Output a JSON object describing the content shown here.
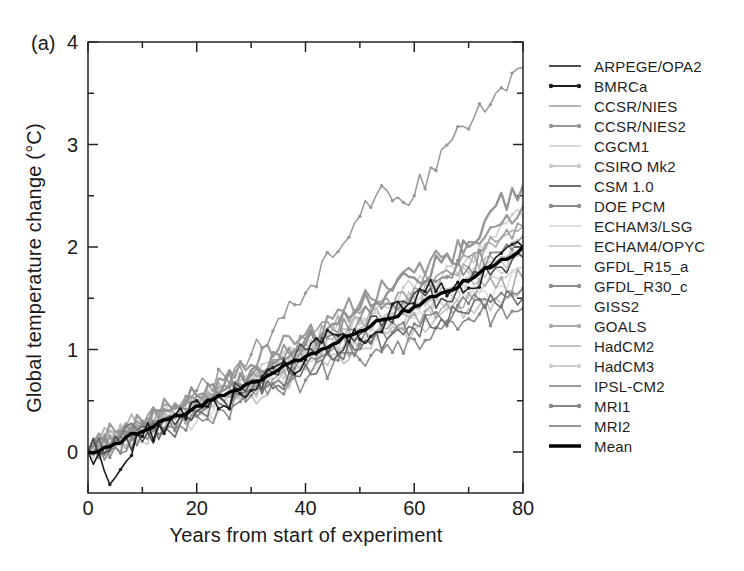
{
  "panel_label": "(a)",
  "chart_data": {
    "type": "line",
    "title": "",
    "xlabel": "Years from start of experiment",
    "ylabel": "Global temperature change (°C)",
    "xlim": [
      0,
      80
    ],
    "ylim": [
      -0.4,
      4.0
    ],
    "x_ticks_major": [
      0,
      20,
      40,
      60,
      80
    ],
    "x_ticks_minor": [
      10,
      30,
      50,
      70
    ],
    "y_ticks_major": [
      0,
      1,
      2,
      3,
      4
    ],
    "y_ticks_minor": [
      0.5,
      1.5,
      2.5,
      3.5
    ],
    "grid": false,
    "legend_position": "right",
    "frame_color": "#242424",
    "text_color": "#1a1a1a",
    "sample_years": [
      0,
      5,
      10,
      15,
      20,
      25,
      30,
      35,
      40,
      45,
      50,
      55,
      60,
      65,
      70,
      75,
      80
    ],
    "series": [
      {
        "name": "ARPEGE/OPA2",
        "color": "#4f4f4f",
        "line_width": 1.6,
        "markers": false,
        "values": [
          0,
          0.15,
          0.1,
          0.35,
          0.4,
          0.5,
          0.7,
          0.75,
          1.0,
          1.05,
          1.15,
          1.3,
          1.55,
          1.5,
          1.65,
          1.8,
          1.9
        ]
      },
      {
        "name": "BMRCa",
        "color": "#1c1c1c",
        "line_width": 1.6,
        "markers": true,
        "values": [
          0,
          -0.25,
          0.15,
          0.3,
          0.5,
          0.45,
          0.6,
          0.85,
          0.9,
          1.15,
          1.1,
          1.3,
          1.45,
          1.65,
          1.6,
          1.9,
          2.0
        ]
      },
      {
        "name": "CCSR/NIES",
        "color": "#b4b4b4",
        "line_width": 1.8,
        "markers": false,
        "values": [
          0,
          0.2,
          0.3,
          0.3,
          0.5,
          0.65,
          0.6,
          0.9,
          1.0,
          1.2,
          1.3,
          1.45,
          1.4,
          1.7,
          1.8,
          2.0,
          2.2
        ]
      },
      {
        "name": "CCSR/NIES2",
        "color": "#989898",
        "line_width": 1.5,
        "markers": true,
        "values": [
          0,
          0.1,
          0.25,
          0.4,
          0.6,
          0.75,
          0.95,
          1.3,
          1.55,
          1.9,
          2.3,
          2.55,
          2.5,
          2.95,
          3.15,
          3.5,
          3.75
        ]
      },
      {
        "name": "CGCM1",
        "color": "#d7d7d7",
        "line_width": 1.8,
        "markers": false,
        "values": [
          0,
          0.05,
          0.2,
          0.35,
          0.3,
          0.5,
          0.6,
          0.7,
          0.9,
          1.0,
          1.15,
          1.2,
          1.4,
          1.45,
          1.6,
          1.7,
          1.8
        ]
      },
      {
        "name": "CSIRO Mk2",
        "color": "#cbcbcb",
        "line_width": 1.6,
        "markers": true,
        "values": [
          0,
          0.15,
          0.1,
          0.3,
          0.45,
          0.55,
          0.7,
          0.8,
          0.95,
          1.05,
          1.25,
          1.3,
          1.5,
          1.55,
          1.75,
          1.85,
          2.0
        ]
      },
      {
        "name": "CSM 1.0",
        "color": "#6f6f6f",
        "line_width": 1.6,
        "markers": false,
        "values": [
          0,
          0.1,
          0.25,
          0.2,
          0.4,
          0.45,
          0.6,
          0.65,
          0.85,
          0.9,
          1.0,
          1.1,
          1.2,
          1.3,
          1.35,
          1.45,
          1.5
        ]
      },
      {
        "name": "DOE PCM",
        "color": "#8c8c8c",
        "line_width": 1.6,
        "markers": true,
        "values": [
          0,
          0.05,
          0.15,
          0.25,
          0.35,
          0.4,
          0.55,
          0.6,
          0.7,
          0.85,
          0.9,
          1.05,
          1.1,
          1.2,
          1.3,
          1.35,
          1.4
        ]
      },
      {
        "name": "ECHAM3/LSG",
        "color": "#e0e0e0",
        "line_width": 1.8,
        "markers": false,
        "values": [
          0,
          0.2,
          0.25,
          0.4,
          0.35,
          0.55,
          0.6,
          0.8,
          0.85,
          1.0,
          1.1,
          1.25,
          1.3,
          1.45,
          1.5,
          1.6,
          1.7
        ]
      },
      {
        "name": "ECHAM4/OPYC",
        "color": "#d2d2d2",
        "line_width": 1.8,
        "markers": false,
        "values": [
          0,
          0.1,
          0.3,
          0.25,
          0.45,
          0.5,
          0.65,
          0.85,
          0.9,
          1.1,
          1.2,
          1.3,
          1.5,
          1.55,
          1.7,
          1.8,
          1.9
        ]
      },
      {
        "name": "GFDL_R15_a",
        "color": "#a0a0a0",
        "line_width": 1.7,
        "markers": false,
        "values": [
          0,
          0.2,
          0.25,
          0.45,
          0.5,
          0.65,
          0.8,
          0.9,
          1.1,
          1.2,
          1.35,
          1.5,
          1.6,
          1.75,
          1.9,
          2.05,
          2.2
        ]
      },
      {
        "name": "GFDL_R30_c",
        "color": "#8f8f8f",
        "line_width": 1.6,
        "markers": true,
        "values": [
          0,
          0.1,
          0.3,
          0.35,
          0.5,
          0.6,
          0.75,
          0.9,
          1.05,
          1.15,
          1.3,
          1.45,
          1.55,
          1.7,
          1.8,
          1.95,
          2.1
        ]
      },
      {
        "name": "GISS2",
        "color": "#c6c6c6",
        "line_width": 1.8,
        "markers": false,
        "values": [
          0,
          0.15,
          0.2,
          0.3,
          0.4,
          0.5,
          0.55,
          0.7,
          0.8,
          0.95,
          1.0,
          1.15,
          1.2,
          1.35,
          1.4,
          1.5,
          1.6
        ]
      },
      {
        "name": "GOALS",
        "color": "#ababab",
        "line_width": 1.6,
        "markers": true,
        "values": [
          0,
          0.1,
          0.2,
          0.35,
          0.4,
          0.55,
          0.65,
          0.75,
          0.9,
          1.0,
          1.1,
          1.2,
          1.35,
          1.4,
          1.55,
          1.6,
          1.7
        ]
      },
      {
        "name": "HadCM2",
        "color": "#c2c2c2",
        "line_width": 2.0,
        "markers": false,
        "values": [
          0,
          0.15,
          0.25,
          0.35,
          0.5,
          0.6,
          0.7,
          0.85,
          1.0,
          1.1,
          1.2,
          1.35,
          1.45,
          1.6,
          1.7,
          1.85,
          2.0
        ]
      },
      {
        "name": "HadCM3",
        "color": "#cfcfcf",
        "line_width": 1.6,
        "markers": true,
        "values": [
          0,
          0.1,
          0.2,
          0.4,
          0.45,
          0.6,
          0.75,
          0.85,
          1.05,
          1.15,
          1.3,
          1.4,
          1.6,
          1.7,
          1.9,
          2.1,
          2.3
        ]
      },
      {
        "name": "IPSL-CM2",
        "color": "#9b9b9b",
        "line_width": 2.2,
        "markers": false,
        "values": [
          0,
          0.2,
          0.3,
          0.45,
          0.55,
          0.7,
          0.85,
          1.0,
          1.15,
          1.3,
          1.45,
          1.6,
          1.75,
          1.9,
          2.05,
          2.2,
          2.4
        ]
      },
      {
        "name": "MRI1",
        "color": "#878787",
        "line_width": 1.6,
        "markers": true,
        "values": [
          0,
          0.05,
          0.2,
          0.3,
          0.35,
          0.5,
          0.6,
          0.7,
          0.85,
          0.9,
          1.05,
          1.1,
          1.25,
          1.3,
          1.45,
          1.5,
          1.6
        ]
      },
      {
        "name": "MRI2",
        "color": "#949494",
        "line_width": 2.4,
        "markers": false,
        "values": [
          0,
          0.15,
          0.3,
          0.4,
          0.55,
          0.65,
          0.8,
          0.95,
          1.1,
          1.25,
          1.4,
          1.55,
          1.7,
          1.85,
          2.0,
          2.4,
          2.6
        ]
      },
      {
        "name": "Mean",
        "color": "#000000",
        "line_width": 3.4,
        "markers": false,
        "values": [
          0,
          0.08,
          0.2,
          0.32,
          0.45,
          0.55,
          0.68,
          0.8,
          0.93,
          1.05,
          1.18,
          1.3,
          1.42,
          1.55,
          1.67,
          1.83,
          2.0
        ]
      }
    ]
  }
}
